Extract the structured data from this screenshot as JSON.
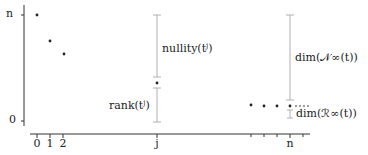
{
  "diagram": {
    "y_axis": {
      "ticks": [
        {
          "label": "n",
          "y": 15
        },
        {
          "label": "0",
          "y": 121
        }
      ]
    },
    "x_axis": {
      "ticks": [
        37,
        50,
        63,
        157,
        251,
        264,
        277,
        290,
        303
      ],
      "labels": [
        {
          "label": "0",
          "x": 37
        },
        {
          "label": "1",
          "x": 50
        },
        {
          "label": "2",
          "x": 63
        },
        {
          "label": "j",
          "x": 157
        },
        {
          "label": "n",
          "x": 290
        }
      ]
    },
    "points": [
      {
        "x": 37,
        "y": 15
      },
      {
        "x": 50,
        "y": 41
      },
      {
        "x": 64,
        "y": 54
      },
      {
        "x": 157,
        "y": 83
      },
      {
        "x": 251,
        "y": 105
      },
      {
        "x": 264,
        "y": 106
      },
      {
        "x": 277,
        "y": 106
      },
      {
        "x": 290,
        "y": 106
      }
    ],
    "ellipsis": "…",
    "annotations": {
      "nullity": "nullity(t",
      "nullity_sup": "j",
      "nullity_close": ")",
      "rank": "rank(t",
      "rank_sup": "j",
      "rank_close": ")",
      "dim_N": "dim(𝒩∞(t))",
      "dim_R": "dim(ℛ∞(t))"
    },
    "colors": {
      "axis": "#333333",
      "bracket": "#b0b0b0",
      "dot": "#222222"
    }
  }
}
